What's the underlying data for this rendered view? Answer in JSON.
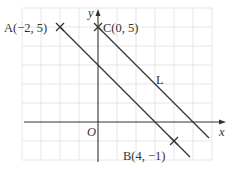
{
  "figure": {
    "axes": {
      "x_label": "x",
      "y_label": "y",
      "origin_label": "O",
      "x_range": [
        -4,
        6
      ],
      "y_range": [
        -2,
        6
      ],
      "grid": true
    },
    "points": [
      {
        "name": "A",
        "label": "A(−2, 5)",
        "x": -2,
        "y": 5
      },
      {
        "name": "C",
        "label": "C(0, 5)",
        "x": 0,
        "y": 5
      },
      {
        "name": "B",
        "label": "B(4, −1)",
        "x": 4,
        "y": -1
      }
    ],
    "lines": [
      {
        "name": "AB",
        "equation": "y = -x + 3"
      },
      {
        "name": "L",
        "label": "L",
        "equation": "y = -x + 5"
      }
    ],
    "colors": {
      "axis": "#333333",
      "line": "#333333",
      "grid": "#e4e4e4"
    }
  }
}
